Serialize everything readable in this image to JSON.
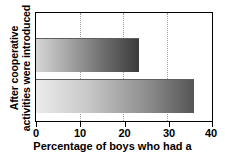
{
  "chart_data": {
    "type": "bar",
    "orientation": "horizontal",
    "title": "",
    "xlabel": "Percentage of boys who had a",
    "ylabel_lines": [
      "After cooperative",
      "activities were introduced"
    ],
    "ylabel": "After cooperative activities were introduced",
    "categories": [
      "bar-1",
      "bar-2"
    ],
    "values": [
      23.5,
      36.2
    ],
    "xlim": [
      0,
      40
    ],
    "xticks": [
      0,
      10,
      20,
      30,
      40
    ],
    "xtick_labels": [
      "0",
      "10",
      "20",
      "30",
      "40"
    ],
    "grid": "vertical-dotted",
    "legend": "none",
    "bar_style": "horizontal-gradient-light-to-dark",
    "colors": {
      "bar1_start": "#d6d6d6",
      "bar1_end": "#3b3b3b",
      "bar2_start": "#ececec",
      "bar2_end": "#555555",
      "axis": "#000000",
      "grid": "#9a9a9a",
      "background": "#ffffff"
    }
  }
}
